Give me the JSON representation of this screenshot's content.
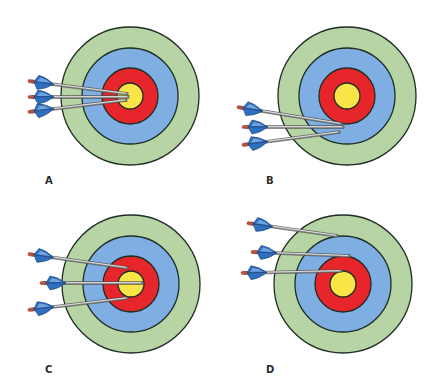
{
  "colors": {
    "outer_ring": "#b7d5a4",
    "middle_ring": "#7eaee2",
    "inner_ring": "#e6262b",
    "bullseye": "#f9e547",
    "ring_stroke": "#1f2d24",
    "shaft": "#8c8c8c",
    "shaft_highlight": "#f0f0f0",
    "fletching": "#2f6fbf",
    "fletching_light": "#7fb0e6",
    "nock": "#c0503a"
  },
  "rings": {
    "outer_r": 69,
    "middle_r": 48,
    "inner_r": 28,
    "bullseye_r": 13
  },
  "panels": [
    {
      "label": "A",
      "label_pos": [
        45,
        175
      ],
      "center": [
        130,
        96
      ],
      "arrows": [
        {
          "nock": [
            28,
            81
          ],
          "tip": [
            128,
            94
          ]
        },
        {
          "nock": [
            28,
            97
          ],
          "tip": [
            129,
            97
          ]
        },
        {
          "nock": [
            28,
            112
          ],
          "tip": [
            127,
            100
          ]
        }
      ]
    },
    {
      "label": "B",
      "label_pos": [
        266,
        175
      ],
      "center": [
        347,
        96
      ],
      "arrows": [
        {
          "nock": [
            237,
            107
          ],
          "tip": [
            342,
            124
          ]
        },
        {
          "nock": [
            242,
            127
          ],
          "tip": [
            344,
            127
          ]
        },
        {
          "nock": [
            242,
            145
          ],
          "tip": [
            340,
            132
          ]
        }
      ]
    },
    {
      "label": "C",
      "label_pos": [
        45,
        364
      ],
      "center": [
        131,
        284
      ],
      "arrows": [
        {
          "nock": [
            28,
            254
          ],
          "tip": [
            128,
            268
          ]
        },
        {
          "nock": [
            40,
            283
          ],
          "tip": [
            143,
            283
          ]
        },
        {
          "nock": [
            28,
            310
          ],
          "tip": [
            128,
            298
          ]
        }
      ]
    },
    {
      "label": "D",
      "label_pos": [
        266,
        364
      ],
      "center": [
        343,
        284
      ],
      "arrows": [
        {
          "nock": [
            247,
            223
          ],
          "tip": [
            338,
            236
          ]
        },
        {
          "nock": [
            251,
            252
          ],
          "tip": [
            350,
            256
          ]
        },
        {
          "nock": [
            241,
            273
          ],
          "tip": [
            342,
            271
          ]
        }
      ]
    }
  ]
}
